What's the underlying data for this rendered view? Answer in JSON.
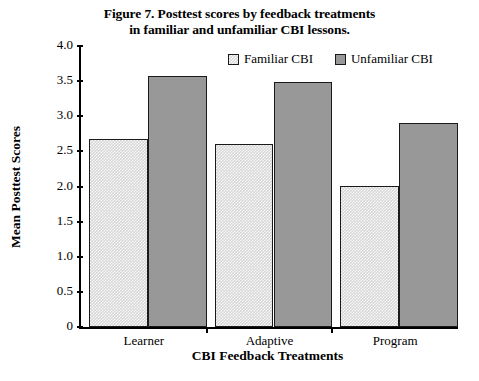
{
  "chart_data": {
    "type": "bar",
    "title": "Figure 7. Posttest scores by feedback treatments in familiar and unfamiliar CBI lessons.",
    "title_lines": [
      "Figure 7. Posttest scores by feedback treatments",
      "in familiar and unfamiliar CBI lessons."
    ],
    "categories": [
      "Learner",
      "Adaptive",
      "Program"
    ],
    "series": [
      {
        "name": "Familiar CBI",
        "values": [
          2.68,
          2.6,
          2.01
        ],
        "color": "#d6d6d6",
        "pattern": "checkered"
      },
      {
        "name": "Unfamiliar CBI",
        "values": [
          3.58,
          3.49,
          2.91
        ],
        "color": "#989898",
        "pattern": "solid"
      }
    ],
    "xlabel": "CBI Feedback Treatments",
    "ylabel": "Mean Posttest Scores",
    "ylim": [
      0,
      4.0
    ],
    "yticks": [
      "0",
      "0.5",
      "1.0",
      "1.5",
      "2.0",
      "2.5",
      "3.0",
      "3.5",
      "4.0"
    ],
    "ytick_values": [
      0,
      0.5,
      1.0,
      1.5,
      2.0,
      2.5,
      3.0,
      3.5,
      4.0
    ],
    "grid": false,
    "legend_position": "top-right",
    "legend": [
      "Familiar CBI",
      "Unfamiliar CBI"
    ]
  }
}
